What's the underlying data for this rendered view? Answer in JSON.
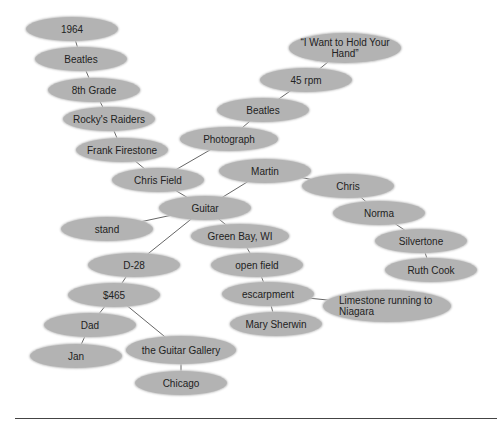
{
  "diagram": {
    "type": "cluster-map",
    "fill_color": "#b3b3b3",
    "line_color": "#666666",
    "nodes": [
      {
        "id": "n1964",
        "label": "1964",
        "x": 72,
        "y": 29,
        "w": 92,
        "h": 24
      },
      {
        "id": "beatles1",
        "label": "Beatles",
        "x": 81,
        "y": 59,
        "w": 92,
        "h": 24
      },
      {
        "id": "grade8",
        "label": "8th Grade",
        "x": 94,
        "y": 90,
        "w": 92,
        "h": 24
      },
      {
        "id": "rocky",
        "label": "Rocky's Raiders",
        "x": 109,
        "y": 119,
        "w": 92,
        "h": 24
      },
      {
        "id": "frank",
        "label": "Frank Firestone",
        "x": 122,
        "y": 150,
        "w": 92,
        "h": 24
      },
      {
        "id": "chrisfield",
        "label": "Chris Field",
        "x": 158,
        "y": 180,
        "w": 92,
        "h": 24
      },
      {
        "id": "photo",
        "label": "Photograph",
        "x": 229,
        "y": 139,
        "w": 98,
        "h": 24
      },
      {
        "id": "beatles2",
        "label": "Beatles",
        "x": 263,
        "y": 110,
        "w": 92,
        "h": 24
      },
      {
        "id": "rpm",
        "label": "45 rpm",
        "x": 306,
        "y": 80,
        "w": 92,
        "h": 24
      },
      {
        "id": "wanthand",
        "label": "“I Want to Hold Your Hand”",
        "x": 345,
        "y": 48,
        "w": 112,
        "h": 30
      },
      {
        "id": "martin",
        "label": "Martin",
        "x": 265,
        "y": 171,
        "w": 92,
        "h": 24
      },
      {
        "id": "chris",
        "label": "Chris",
        "x": 348,
        "y": 186,
        "w": 92,
        "h": 24
      },
      {
        "id": "norma",
        "label": "Norma",
        "x": 379,
        "y": 213,
        "w": 92,
        "h": 24
      },
      {
        "id": "silvertone",
        "label": "Silvertone",
        "x": 421,
        "y": 241,
        "w": 92,
        "h": 24
      },
      {
        "id": "ruthcook",
        "label": "Ruth Cook",
        "x": 431,
        "y": 270,
        "w": 92,
        "h": 24
      },
      {
        "id": "guitar",
        "label": "Guitar",
        "x": 205,
        "y": 208,
        "w": 92,
        "h": 24
      },
      {
        "id": "stand",
        "label": "stand",
        "x": 107,
        "y": 229,
        "w": 92,
        "h": 24
      },
      {
        "id": "greenbay",
        "label": "Green Bay, WI",
        "x": 240,
        "y": 236,
        "w": 98,
        "h": 24
      },
      {
        "id": "d28",
        "label": "D-28",
        "x": 134,
        "y": 265,
        "w": 92,
        "h": 24
      },
      {
        "id": "openfield",
        "label": "open field",
        "x": 257,
        "y": 265,
        "w": 92,
        "h": 24
      },
      {
        "id": "price",
        "label": "$465",
        "x": 114,
        "y": 295,
        "w": 92,
        "h": 24
      },
      {
        "id": "escarpment",
        "label": "escarpment",
        "x": 268,
        "y": 294,
        "w": 92,
        "h": 24
      },
      {
        "id": "limestone",
        "label": "Limestone running to Niagara",
        "x": 387,
        "y": 306,
        "w": 128,
        "h": 32,
        "align": "left"
      },
      {
        "id": "marysherwin",
        "label": "Mary Sherwin",
        "x": 276,
        "y": 324,
        "w": 92,
        "h": 24
      },
      {
        "id": "dad",
        "label": "Dad",
        "x": 90,
        "y": 325,
        "w": 92,
        "h": 24
      },
      {
        "id": "jan",
        "label": "Jan",
        "x": 76,
        "y": 356,
        "w": 92,
        "h": 24
      },
      {
        "id": "guitargallery",
        "label": "the Guitar Gallery",
        "x": 181,
        "y": 350,
        "w": 110,
        "h": 28
      },
      {
        "id": "chicago",
        "label": "Chicago",
        "x": 181,
        "y": 383,
        "w": 92,
        "h": 24
      }
    ],
    "edges": [
      [
        "n1964",
        "beatles1"
      ],
      [
        "beatles1",
        "grade8"
      ],
      [
        "grade8",
        "rocky"
      ],
      [
        "rocky",
        "frank"
      ],
      [
        "frank",
        "chrisfield"
      ],
      [
        "chrisfield",
        "photo"
      ],
      [
        "photo",
        "beatles2"
      ],
      [
        "beatles2",
        "rpm"
      ],
      [
        "rpm",
        "wanthand"
      ],
      [
        "chrisfield",
        "guitar"
      ],
      [
        "guitar",
        "martin"
      ],
      [
        "martin",
        "chris"
      ],
      [
        "chris",
        "norma"
      ],
      [
        "norma",
        "silvertone"
      ],
      [
        "silvertone",
        "ruthcook"
      ],
      [
        "guitar",
        "stand"
      ],
      [
        "guitar",
        "greenbay"
      ],
      [
        "guitar",
        "d28"
      ],
      [
        "greenbay",
        "openfield"
      ],
      [
        "openfield",
        "escarpment"
      ],
      [
        "escarpment",
        "limestone"
      ],
      [
        "escarpment",
        "marysherwin"
      ],
      [
        "d28",
        "price"
      ],
      [
        "price",
        "dad"
      ],
      [
        "dad",
        "jan"
      ],
      [
        "price",
        "guitargallery"
      ],
      [
        "guitargallery",
        "chicago"
      ]
    ]
  }
}
